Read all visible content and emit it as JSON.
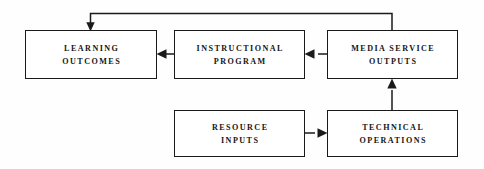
{
  "diagram": {
    "background_color": "#fefefe",
    "line_color": "#1a1a1a",
    "text_color": "#151515",
    "nodes": [
      {
        "id": "learning-outcomes",
        "line1": "LEARNING",
        "line2": "OUTCOMES",
        "x": 25,
        "y": 30,
        "width": 132,
        "height": 49
      },
      {
        "id": "instructional-program",
        "line1": "INSTRUCTIONAL",
        "line2": "PROGRAM",
        "x": 174,
        "y": 30,
        "width": 131,
        "height": 49
      },
      {
        "id": "media-service-outputs",
        "line1": "MEDIA SERVICE",
        "line2": "OUTPUTS",
        "x": 327,
        "y": 30,
        "width": 131,
        "height": 49
      },
      {
        "id": "resource-inputs",
        "line1": "RESOURCE",
        "line2": "INPUTS",
        "x": 174,
        "y": 110,
        "width": 131,
        "height": 47
      },
      {
        "id": "technical-operations",
        "line1": "TECHNICAL",
        "line2": "OPERATIONS",
        "x": 327,
        "y": 110,
        "width": 131,
        "height": 47
      }
    ],
    "edges": [
      {
        "id": "instructional-to-learning",
        "from": "instructional-program",
        "to": "learning-outcomes",
        "direction": "left"
      },
      {
        "id": "media-to-instructional",
        "from": "media-service-outputs",
        "to": "instructional-program",
        "direction": "left"
      },
      {
        "id": "resource-to-technical",
        "from": "resource-inputs",
        "to": "technical-operations",
        "direction": "right"
      },
      {
        "id": "technical-to-media",
        "from": "technical-operations",
        "to": "media-service-outputs",
        "direction": "up"
      },
      {
        "id": "media-feedback-to-learning",
        "from": "media-service-outputs",
        "to": "learning-outcomes",
        "direction": "down-feedback"
      }
    ]
  }
}
